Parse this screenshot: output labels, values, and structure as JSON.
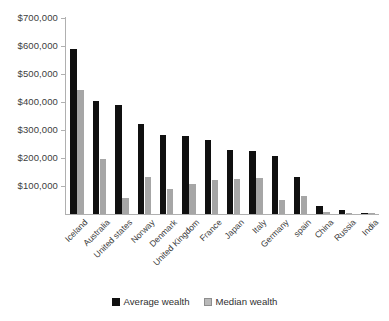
{
  "chart_data": {
    "type": "bar",
    "title": "",
    "subtitle": "",
    "xlabel": "",
    "ylabel": "",
    "ylim": [
      0,
      700000
    ],
    "y_tick_labels": [
      "$700,000",
      "$600,000",
      "$500,000",
      "$400,000",
      "$300,000",
      "$200,000",
      "$100,000"
    ],
    "y_tick_values": [
      700000,
      600000,
      500000,
      400000,
      300000,
      200000,
      100000
    ],
    "grid": false,
    "legend_position": "bottom",
    "categories": [
      "Iceland",
      "Australia",
      "United states",
      "Norway",
      "Denmark",
      "United Kingdom",
      "France",
      "Japan",
      "Italy",
      "Germany",
      "spain",
      "China",
      "Russia",
      "India"
    ],
    "series": [
      {
        "name": "Average wealth",
        "color": "#101010",
        "values": [
          588000,
          403000,
          389000,
          322000,
          283000,
          279000,
          265000,
          227000,
          226000,
          207000,
          133000,
          30000,
          15000,
          5000
        ]
      },
      {
        "name": "Median wealth",
        "color": "#a6a6a6",
        "values": [
          444000,
          195000,
          58000,
          132000,
          89000,
          106000,
          122000,
          126000,
          127000,
          50000,
          66000,
          7000,
          4000,
          2000
        ]
      }
    ]
  },
  "legend": {
    "items": [
      {
        "label": "Average wealth",
        "swatch": "black-square-icon"
      },
      {
        "label": "Median wealth",
        "swatch": "gray-square-icon"
      }
    ]
  }
}
